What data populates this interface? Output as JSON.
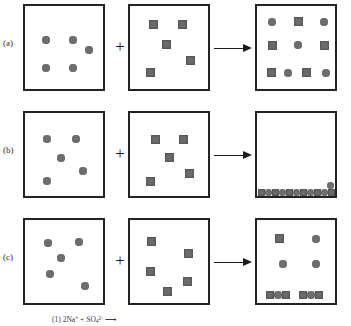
{
  "figure": {
    "width": 351,
    "height": 326,
    "colors": {
      "background": "#ffffff",
      "box_border": "#232323",
      "circle_fill": "#6e6e6e",
      "square_fill": "#6b6b6b",
      "arrow": "#1b1b1b",
      "text": "#2a2a2a"
    },
    "operators": {
      "plus": "+",
      "arrow": "⟶"
    }
  },
  "rows": [
    {
      "label": "(a)",
      "top": 0,
      "boxes": [
        {
          "name": "reactant-box-a-1",
          "particles": [
            {
              "shape": "circle",
              "x": 17,
              "y": 30,
              "size": 8
            },
            {
              "shape": "circle",
              "x": 44,
              "y": 30,
              "size": 8
            },
            {
              "shape": "circle",
              "x": 60,
              "y": 40,
              "size": 8
            },
            {
              "shape": "circle",
              "x": 17,
              "y": 58,
              "size": 8
            },
            {
              "shape": "circle",
              "x": 44,
              "y": 58,
              "size": 8
            }
          ]
        },
        {
          "name": "reactant-box-a-2",
          "particles": [
            {
              "shape": "square",
              "x": 19,
              "y": 14,
              "size": 9
            },
            {
              "shape": "square",
              "x": 48,
              "y": 14,
              "size": 9
            },
            {
              "shape": "square",
              "x": 32,
              "y": 34,
              "size": 9
            },
            {
              "shape": "square",
              "x": 56,
              "y": 50,
              "size": 9
            },
            {
              "shape": "square",
              "x": 16,
              "y": 62,
              "size": 9
            }
          ]
        },
        {
          "name": "product-box-a-3",
          "particles": [
            {
              "shape": "circle",
              "x": 11,
              "y": 12,
              "size": 8
            },
            {
              "shape": "square",
              "x": 37,
              "y": 11,
              "size": 9
            },
            {
              "shape": "circle",
              "x": 63,
              "y": 12,
              "size": 8
            },
            {
              "shape": "square",
              "x": 11,
              "y": 35,
              "size": 9
            },
            {
              "shape": "circle",
              "x": 37,
              "y": 35,
              "size": 8
            },
            {
              "shape": "square",
              "x": 63,
              "y": 35,
              "size": 9
            },
            {
              "shape": "square",
              "x": 10,
              "y": 62,
              "size": 9
            },
            {
              "shape": "circle",
              "x": 27,
              "y": 63,
              "size": 8
            },
            {
              "shape": "square",
              "x": 45,
              "y": 62,
              "size": 9
            },
            {
              "shape": "circle",
              "x": 65,
              "y": 63,
              "size": 8
            }
          ]
        }
      ]
    },
    {
      "label": "(b)",
      "top": 107,
      "boxes": [
        {
          "name": "reactant-box-b-1",
          "particles": [
            {
              "shape": "circle",
              "x": 18,
              "y": 22,
              "size": 8
            },
            {
              "shape": "circle",
              "x": 47,
              "y": 22,
              "size": 8
            },
            {
              "shape": "circle",
              "x": 32,
              "y": 41,
              "size": 8
            },
            {
              "shape": "circle",
              "x": 54,
              "y": 54,
              "size": 8
            },
            {
              "shape": "circle",
              "x": 18,
              "y": 64,
              "size": 8
            }
          ]
        },
        {
          "name": "reactant-box-b-2",
          "particles": [
            {
              "shape": "square",
              "x": 21,
              "y": 22,
              "size": 9
            },
            {
              "shape": "square",
              "x": 49,
              "y": 22,
              "size": 9
            },
            {
              "shape": "square",
              "x": 35,
              "y": 40,
              "size": 9
            },
            {
              "shape": "square",
              "x": 55,
              "y": 56,
              "size": 9
            },
            {
              "shape": "square",
              "x": 16,
              "y": 64,
              "size": 9
            }
          ]
        },
        {
          "name": "product-box-b-3",
          "precipitate_layer": {
            "name": "precipitate-bed",
            "pattern": [
              "square",
              "circle",
              "square",
              "circle",
              "square",
              "circle",
              "square",
              "circle",
              "square",
              "circle",
              "square"
            ],
            "stacked_circle": true
          },
          "particles": []
        }
      ]
    },
    {
      "label": "(c)",
      "top": 214,
      "boxes": [
        {
          "name": "reactant-box-c-1",
          "particles": [
            {
              "shape": "circle",
              "x": 19,
              "y": 19,
              "size": 8
            },
            {
              "shape": "circle",
              "x": 50,
              "y": 18,
              "size": 8
            },
            {
              "shape": "circle",
              "x": 32,
              "y": 34,
              "size": 8
            },
            {
              "shape": "circle",
              "x": 21,
              "y": 50,
              "size": 8
            },
            {
              "shape": "circle",
              "x": 56,
              "y": 62,
              "size": 8
            }
          ]
        },
        {
          "name": "reactant-box-c-2",
          "particles": [
            {
              "shape": "square",
              "x": 17,
              "y": 17,
              "size": 9
            },
            {
              "shape": "square",
              "x": 54,
              "y": 29,
              "size": 9
            },
            {
              "shape": "square",
              "x": 16,
              "y": 47,
              "size": 9
            },
            {
              "shape": "square",
              "x": 53,
              "y": 57,
              "size": 9
            },
            {
              "shape": "square",
              "x": 33,
              "y": 67,
              "size": 9
            }
          ]
        },
        {
          "name": "product-box-c-3",
          "particles": [
            {
              "shape": "square",
              "x": 18,
              "y": 14,
              "size": 9
            },
            {
              "shape": "circle",
              "x": 55,
              "y": 15,
              "size": 8
            },
            {
              "shape": "circle",
              "x": 22,
              "y": 40,
              "size": 8
            },
            {
              "shape": "circle",
              "x": 55,
              "y": 40,
              "size": 8
            }
          ],
          "precipitate_clusters": [
            {
              "name": "precipitate-cluster-left",
              "pattern": [
                "square",
                "circle",
                "square"
              ]
            },
            {
              "name": "precipitate-cluster-right",
              "pattern": [
                "square",
                "circle",
                "square"
              ]
            }
          ]
        }
      ]
    }
  ],
  "caption": {
    "text": "(1)  2Na+ + SO42-",
    "item_number": "(1)",
    "species_1": "2Na",
    "species_1_charge": "+",
    "species_2": "SO",
    "species_2_sub": "4",
    "species_2_charge": "2-",
    "arrow": "⟶"
  }
}
